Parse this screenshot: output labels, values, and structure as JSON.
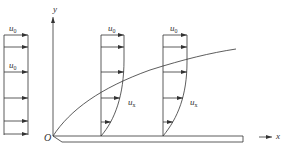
{
  "diagram": {
    "colors": {
      "line": "#333333",
      "background": "#ffffff"
    },
    "axes": {
      "y_label": "y",
      "x_label": "x",
      "origin_label": "O"
    },
    "free_stream": {
      "label_top": "u",
      "label_top_sub": "0",
      "label_mid": "u",
      "label_mid_sub": "0"
    },
    "profiles": [
      {
        "free_stream_label": "u",
        "free_stream_sub": "0",
        "local_label": "u",
        "local_sub": "x"
      },
      {
        "free_stream_label": "u",
        "free_stream_sub": "0",
        "local_label": "u",
        "local_sub": "x"
      }
    ]
  }
}
